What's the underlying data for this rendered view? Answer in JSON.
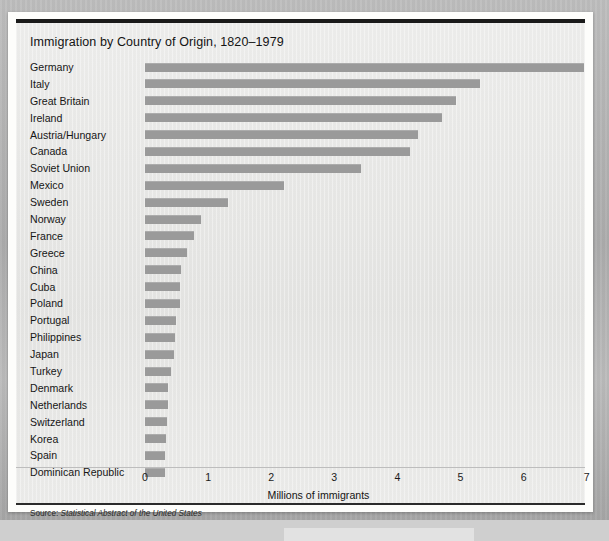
{
  "figure": {
    "title": "Immigration by Country of Origin, 1820–1979",
    "source_prefix": "Source:",
    "source_italic": "Statistical Abstract of the United States"
  },
  "chart_data": {
    "type": "bar",
    "orientation": "horizontal",
    "title": "Immigration by Country of Origin, 1820–1979",
    "subtitle": "",
    "xlabel": "Millions of immigrants",
    "ylabel": "",
    "xlim": [
      0,
      7
    ],
    "xticks": [
      0,
      1,
      2,
      3,
      4,
      5,
      6,
      7
    ],
    "xtick_labels": [
      "0",
      "1",
      "2",
      "3",
      "4",
      "5",
      "6",
      "7"
    ],
    "grid": false,
    "legend": false,
    "bar_color": "#9a9a9a",
    "units": "millions of immigrants",
    "categories": [
      "Germany",
      "Italy",
      "Great Britain",
      "Ireland",
      "Austria/Hungary",
      "Canada",
      "Soviet Union",
      "Mexico",
      "Sweden",
      "Norway",
      "France",
      "Greece",
      "China",
      "Cuba",
      "Poland",
      "Portugal",
      "Philippines",
      "Japan",
      "Turkey",
      "Denmark",
      "Netherlands",
      "Switzerland",
      "Korea",
      "Spain",
      "Dominican Republic"
    ],
    "values": [
      6.96,
      5.31,
      4.93,
      4.7,
      4.33,
      4.2,
      3.42,
      2.21,
      1.31,
      0.88,
      0.78,
      0.67,
      0.57,
      0.56,
      0.55,
      0.49,
      0.48,
      0.46,
      0.41,
      0.37,
      0.36,
      0.35,
      0.34,
      0.32,
      0.31
    ]
  }
}
